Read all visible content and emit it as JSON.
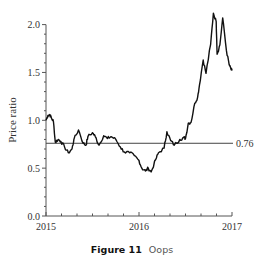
{
  "chart_data": {
    "type": "line",
    "title": "",
    "xlabel": "",
    "ylabel": "Price ratio",
    "xlim": [
      2015,
      2017
    ],
    "ylim": [
      0.0,
      2.0
    ],
    "x_ticks": [
      2015,
      2016,
      2017
    ],
    "x_tick_labels": [
      "2015",
      "2016",
      "2017"
    ],
    "y_ticks": [
      0.0,
      0.5,
      1.0,
      1.5,
      2.0
    ],
    "y_tick_labels": [
      "0.0",
      "0.5",
      "1.0",
      "1.5",
      "2.0"
    ],
    "grid": false,
    "legend": null,
    "series": [
      {
        "name": "Price ratio",
        "color": "#111111",
        "x": [
          2015.0,
          2015.02,
          2015.04,
          2015.06,
          2015.08,
          2015.1,
          2015.13,
          2015.16,
          2015.2,
          2015.24,
          2015.28,
          2015.3,
          2015.35,
          2015.4,
          2015.43,
          2015.45,
          2015.5,
          2015.53,
          2015.57,
          2015.62,
          2015.66,
          2015.7,
          2015.75,
          2015.8,
          2015.84,
          2015.9,
          2015.95,
          2016.0,
          2016.03,
          2016.07,
          2016.1,
          2016.13,
          2016.18,
          2016.21,
          2016.27,
          2016.3,
          2016.34,
          2016.38,
          2016.44,
          2016.48,
          2016.5,
          2016.53,
          2016.56,
          2016.6,
          2016.63,
          2016.65,
          2016.69,
          2016.72,
          2016.77,
          2016.8,
          2016.83,
          2016.84,
          2016.87,
          2016.9,
          2016.94,
          2016.97,
          2016.99,
          2017.0
        ],
        "values": [
          1.0,
          1.05,
          1.06,
          1.02,
          0.99,
          0.77,
          0.8,
          0.78,
          0.72,
          0.66,
          0.7,
          0.8,
          0.9,
          0.76,
          0.74,
          0.83,
          0.87,
          0.83,
          0.74,
          0.84,
          0.81,
          0.83,
          0.8,
          0.72,
          0.67,
          0.66,
          0.63,
          0.58,
          0.5,
          0.47,
          0.5,
          0.46,
          0.59,
          0.66,
          0.71,
          0.88,
          0.79,
          0.74,
          0.8,
          0.82,
          0.81,
          0.97,
          0.98,
          1.18,
          1.24,
          1.37,
          1.63,
          1.49,
          1.79,
          2.12,
          2.03,
          1.69,
          1.79,
          2.07,
          1.73,
          1.58,
          1.53,
          1.52
        ]
      }
    ],
    "annotations": [
      {
        "type": "hline",
        "y": 0.76,
        "label": "0.76",
        "color": "#444444"
      }
    ]
  },
  "caption": {
    "figure_label": "Figure 11",
    "text": "Oops"
  }
}
